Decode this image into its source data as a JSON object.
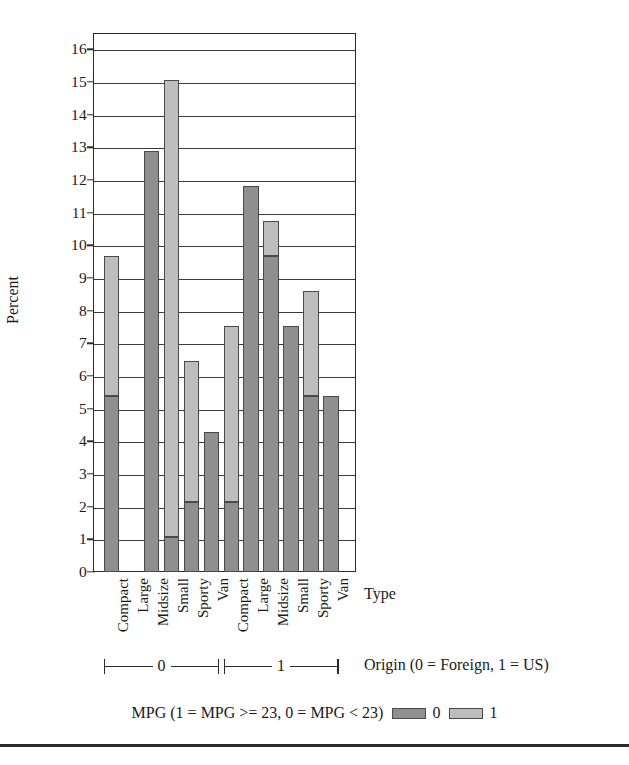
{
  "chart_data": {
    "type": "bar",
    "title": "",
    "subtype": "stacked-grouped-bar",
    "ylabel": "Percent",
    "xlabel": "Type",
    "ylim": [
      0,
      16.5
    ],
    "yticks": [
      0,
      1,
      2,
      3,
      4,
      5,
      6,
      7,
      8,
      9,
      10,
      11,
      12,
      13,
      14,
      15,
      16
    ],
    "ytick_labels": [
      "0",
      "1",
      "2",
      "3",
      "4",
      "5",
      "6",
      "7",
      "8",
      "9",
      "10",
      "11",
      "12",
      "13",
      "14",
      "15",
      "16"
    ],
    "grid": true,
    "grid_axis": "y",
    "categories": [
      "Compact",
      "Large",
      "Midsize",
      "Small",
      "Sporty",
      "Van"
    ],
    "groups": [
      {
        "key": "0",
        "label": "0",
        "meaning": "Foreign"
      },
      {
        "key": "1",
        "label": "1",
        "meaning": "US"
      }
    ],
    "group_axis_label": "Origin (0 = Foreign, 1 = US)",
    "legend_title": "MPG (1 = MPG >= 23, 0 = MPG < 23)",
    "legend_position": "bottom",
    "series": [
      {
        "name": "0",
        "label": "0",
        "color": "#8f8f8f",
        "values": {
          "0": [
            5.38,
            0.0,
            12.9,
            1.08,
            2.15,
            4.3
          ],
          "1": [
            2.15,
            11.83,
            9.68,
            7.53,
            5.38,
            5.38
          ]
        }
      },
      {
        "name": "1",
        "label": "1",
        "color": "#bdbdbd",
        "values": {
          "0": [
            4.3,
            0.0,
            0.0,
            13.98,
            4.3,
            0.0
          ],
          "1": [
            5.38,
            0.0,
            1.08,
            0.0,
            3.23,
            0.0
          ]
        }
      }
    ],
    "totals": {
      "0": [
        9.68,
        0.0,
        12.9,
        15.05,
        6.45,
        4.3
      ],
      "1": [
        7.53,
        11.83,
        10.75,
        7.53,
        8.6,
        5.38
      ]
    }
  },
  "axis": {
    "y_title": "Percent",
    "x_title": "Type",
    "origin_title": "Origin (0 = Foreign, 1 = US)"
  },
  "legend": {
    "title": "MPG (1 = MPG >= 23, 0 = MPG < 23)",
    "items": [
      {
        "label": "0",
        "color": "#8f8f8f"
      },
      {
        "label": "1",
        "color": "#bdbdbd"
      }
    ]
  },
  "colors": {
    "series_0": "#8f8f8f",
    "series_1": "#bdbdbd",
    "axis": "#2b2b2b",
    "grid": "#3a3a3a",
    "background": "#ffffff"
  }
}
